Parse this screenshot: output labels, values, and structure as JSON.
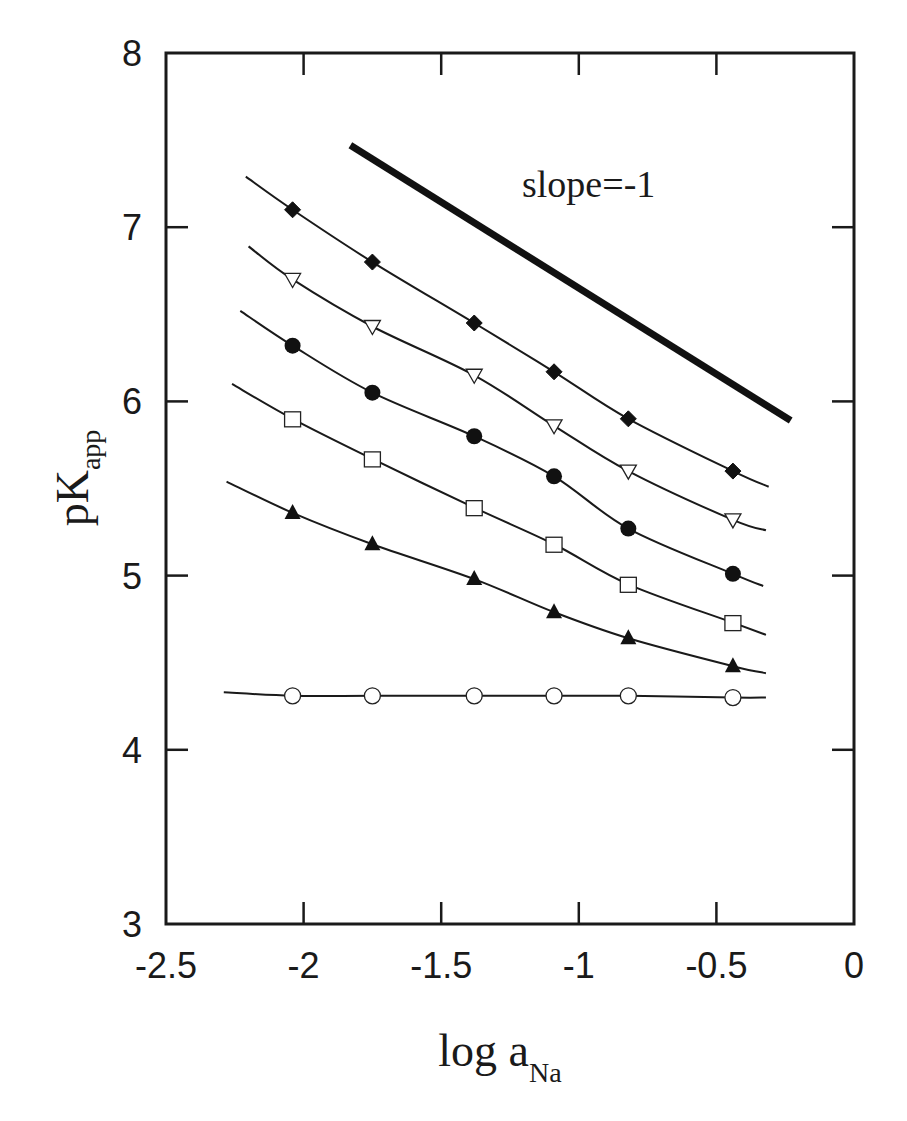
{
  "chart_data": {
    "type": "line",
    "title": "",
    "xlabel": "log a",
    "xlabel_subscript": "Na",
    "ylabel": "pK",
    "ylabel_subscript": "app",
    "xlim": [
      -2.5,
      0
    ],
    "ylim": [
      3,
      8
    ],
    "x_ticks": [
      -2.5,
      -2,
      -1.5,
      -1,
      -0.5,
      0
    ],
    "x_tick_labels": [
      "-2.5",
      "-2",
      "-1.5",
      "-1",
      "-0.5",
      "0"
    ],
    "y_ticks": [
      3,
      4,
      5,
      6,
      7,
      8
    ],
    "y_tick_labels": [
      "3",
      "4",
      "5",
      "6",
      "7",
      "8"
    ],
    "grid": false,
    "legend": null,
    "x": [
      -2.04,
      -1.75,
      -1.38,
      -1.09,
      -0.82,
      -0.44
    ],
    "series": [
      {
        "name": "filled diamonds",
        "marker": "diamond-filled",
        "values": [
          7.1,
          6.8,
          6.45,
          6.17,
          5.9,
          5.6
        ],
        "fit_line": [
          [
            -2.21,
            7.29
          ],
          [
            -0.31,
            5.51
          ]
        ]
      },
      {
        "name": "open down-triangles",
        "marker": "triangle-down-open",
        "values": [
          6.7,
          6.43,
          6.15,
          5.86,
          5.6,
          5.32
        ],
        "fit_line": [
          [
            -2.2,
            6.89
          ],
          [
            -0.32,
            5.26
          ]
        ]
      },
      {
        "name": "filled circles",
        "marker": "circle-filled",
        "values": [
          6.32,
          6.05,
          5.8,
          5.57,
          5.27,
          5.01
        ],
        "fit_line": [
          [
            -2.23,
            6.52
          ],
          [
            -0.33,
            4.94
          ]
        ]
      },
      {
        "name": "open squares",
        "marker": "square-open",
        "values": [
          5.9,
          5.67,
          5.39,
          5.18,
          4.95,
          4.73
        ],
        "fit_line": [
          [
            -2.26,
            6.1
          ],
          [
            -0.32,
            4.66
          ]
        ]
      },
      {
        "name": "filled up-triangles",
        "marker": "triangle-up-filled",
        "values": [
          5.36,
          5.18,
          4.98,
          4.79,
          4.64,
          4.48
        ],
        "fit_line": [
          [
            -2.28,
            5.54
          ],
          [
            -0.32,
            4.44
          ]
        ]
      },
      {
        "name": "open circles",
        "marker": "circle-open",
        "values": [
          4.31,
          4.31,
          4.31,
          4.31,
          4.31,
          4.3
        ],
        "fit_line": [
          [
            -2.29,
            4.33
          ],
          [
            -0.32,
            4.3
          ]
        ]
      }
    ],
    "reference_line": {
      "label": "slope=-1",
      "points": [
        [
          -1.83,
          7.47
        ],
        [
          -0.23,
          5.89
        ]
      ],
      "label_position": [
        -1.25,
        7.2
      ]
    }
  }
}
